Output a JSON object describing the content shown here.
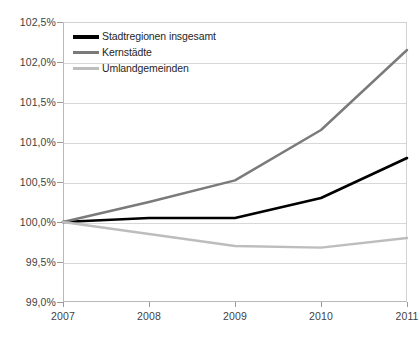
{
  "chart_data": {
    "type": "line",
    "title": "",
    "xlabel": "",
    "ylabel": "",
    "x": [
      "2007",
      "2008",
      "2009",
      "2010",
      "2011"
    ],
    "categories": [
      "2007",
      "2008",
      "2009",
      "2010",
      "2011"
    ],
    "ylim": [
      99.0,
      102.5
    ],
    "xlim": [
      "2007",
      "2011"
    ],
    "grid": true,
    "legend_position": "top-left",
    "y_tick_labels": [
      "102,5%",
      "102,0%",
      "101,5%",
      "101,0%",
      "100,5%",
      "100,0%",
      "99,5%",
      "99,0%"
    ],
    "y_tick_values": [
      102.5,
      102.0,
      101.5,
      101.0,
      100.5,
      100.0,
      99.5,
      99.0
    ],
    "x_tick_labels": [
      "2007",
      "2008",
      "2009",
      "2010",
      "2011"
    ],
    "series": [
      {
        "name": "Stadtregionen insgesamt",
        "color": "#000000",
        "width": 2.6,
        "values": [
          100.0,
          100.05,
          100.05,
          100.3,
          100.8
        ]
      },
      {
        "name": "Kernstädte",
        "color": "#7a7a7a",
        "width": 2.4,
        "values": [
          100.0,
          100.25,
          100.52,
          101.15,
          102.15
        ]
      },
      {
        "name": "Umlandgemeinden",
        "color": "#bdbdbd",
        "width": 2.4,
        "values": [
          100.0,
          99.85,
          99.7,
          99.68,
          99.8
        ]
      }
    ]
  },
  "legend": {
    "items": [
      {
        "label": "Stadtregionen insgesamt",
        "color": "#000000"
      },
      {
        "label": "Kernstädte",
        "color": "#7a7a7a"
      },
      {
        "label": "Umlandgemeinden",
        "color": "#bdbdbd"
      }
    ]
  }
}
